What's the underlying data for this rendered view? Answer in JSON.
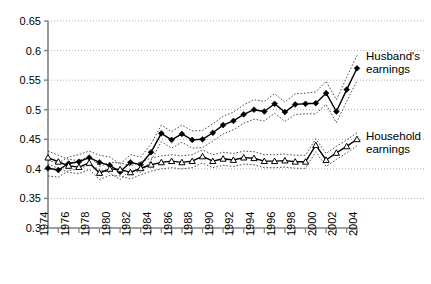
{
  "chart_data": {
    "type": "line",
    "title": "",
    "xlabel": "",
    "ylabel": "",
    "xlim": [
      1974,
      2004
    ],
    "ylim": [
      0.3,
      0.65
    ],
    "grid": true,
    "grid_axis": "y",
    "legend_position": "right-inline",
    "yticks": [
      0.3,
      0.35,
      0.4,
      0.45,
      0.5,
      0.55,
      0.6,
      0.65
    ],
    "ytick_labels": [
      "0.3",
      "0.35",
      "0.4",
      "0.45",
      "0.5",
      "0.55",
      "0.6",
      "0.65"
    ],
    "xticks": [
      1974,
      1975,
      1976,
      1977,
      1978,
      1979,
      1980,
      1981,
      1982,
      1983,
      1984,
      1985,
      1986,
      1987,
      1988,
      1989,
      1990,
      1991,
      1992,
      1993,
      1994,
      1995,
      1996,
      1997,
      1998,
      1999,
      2000,
      2001,
      2002,
      2003,
      2004
    ],
    "xtick_labels": [
      "1974",
      "",
      "1976",
      "",
      "1978",
      "",
      "1980",
      "",
      "1982",
      "",
      "1984",
      "",
      "1986",
      "",
      "1988",
      "",
      "1990",
      "",
      "1992",
      "",
      "1994",
      "",
      "1996",
      "",
      "1998",
      "",
      "2000",
      "",
      "2002",
      "",
      "2004"
    ],
    "x": [
      1974,
      1975,
      1976,
      1977,
      1978,
      1979,
      1980,
      1981,
      1982,
      1983,
      1984,
      1985,
      1986,
      1987,
      1988,
      1989,
      1990,
      1991,
      1992,
      1993,
      1994,
      1995,
      1996,
      1997,
      1998,
      1999,
      2000,
      2001,
      2002,
      2003,
      2004
    ],
    "series": [
      {
        "name": "Husband's earnings",
        "marker": "filled-diamond",
        "line_style": "solid",
        "color": "#000000",
        "values": [
          0.401,
          0.398,
          0.409,
          0.412,
          0.419,
          0.411,
          0.406,
          0.395,
          0.411,
          0.407,
          0.428,
          0.46,
          0.449,
          0.459,
          0.449,
          0.45,
          0.461,
          0.474,
          0.481,
          0.492,
          0.5,
          0.497,
          0.51,
          0.496,
          0.509,
          0.51,
          0.511,
          0.528,
          0.497,
          0.534,
          0.57
        ],
        "ci_upper": [
          0.414,
          0.41,
          0.42,
          0.424,
          0.43,
          0.423,
          0.42,
          0.408,
          0.424,
          0.42,
          0.442,
          0.474,
          0.463,
          0.474,
          0.464,
          0.465,
          0.476,
          0.489,
          0.496,
          0.508,
          0.517,
          0.514,
          0.527,
          0.513,
          0.527,
          0.528,
          0.53,
          0.548,
          0.517,
          0.555,
          0.592
        ],
        "ci_lower": [
          0.388,
          0.386,
          0.397,
          0.4,
          0.407,
          0.399,
          0.393,
          0.382,
          0.398,
          0.394,
          0.414,
          0.446,
          0.435,
          0.445,
          0.435,
          0.436,
          0.447,
          0.459,
          0.466,
          0.477,
          0.484,
          0.481,
          0.494,
          0.48,
          0.492,
          0.493,
          0.493,
          0.509,
          0.478,
          0.514,
          0.549
        ]
      },
      {
        "name": "Household earnings",
        "marker": "open-triangle",
        "line_style": "solid",
        "color": "#000000",
        "values": [
          0.419,
          0.412,
          0.405,
          0.403,
          0.41,
          0.393,
          0.4,
          0.399,
          0.394,
          0.401,
          0.407,
          0.411,
          0.413,
          0.411,
          0.413,
          0.421,
          0.413,
          0.417,
          0.415,
          0.419,
          0.418,
          0.413,
          0.413,
          0.414,
          0.412,
          0.412,
          0.44,
          0.415,
          0.427,
          0.438,
          0.45
        ]
      }
    ],
    "annotations": [
      {
        "text": "Husband's earnings",
        "anchor_year": 2004,
        "anchor_value": 0.57
      },
      {
        "text": "Household earnings",
        "anchor_year": 2004,
        "anchor_value": 0.45
      }
    ]
  },
  "legend": {
    "husband_line1": "Husband's",
    "husband_line2": "earnings",
    "household_line1": "Household",
    "household_line2": "earnings"
  }
}
